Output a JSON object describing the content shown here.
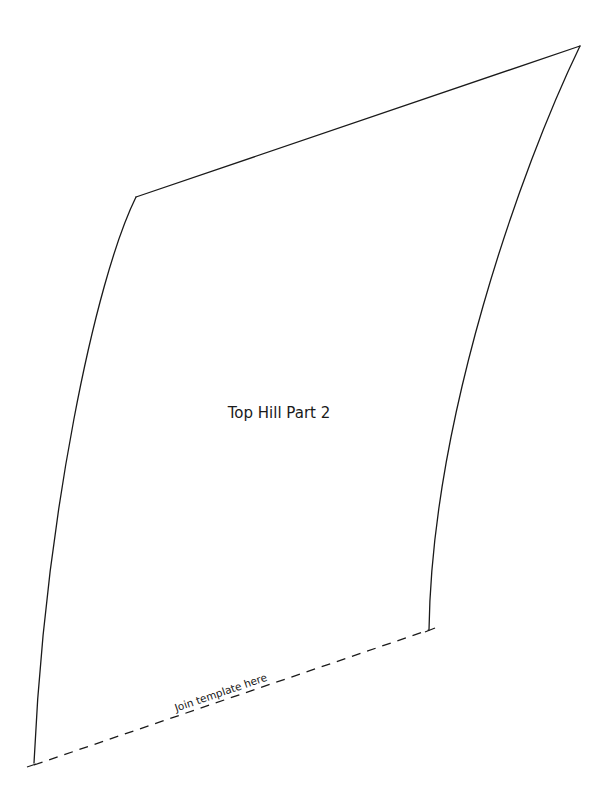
{
  "template": {
    "title": "Top Hill Part 2",
    "join_label": "Join template here",
    "stroke_color": "#1a1a1a",
    "background": "#ffffff"
  }
}
